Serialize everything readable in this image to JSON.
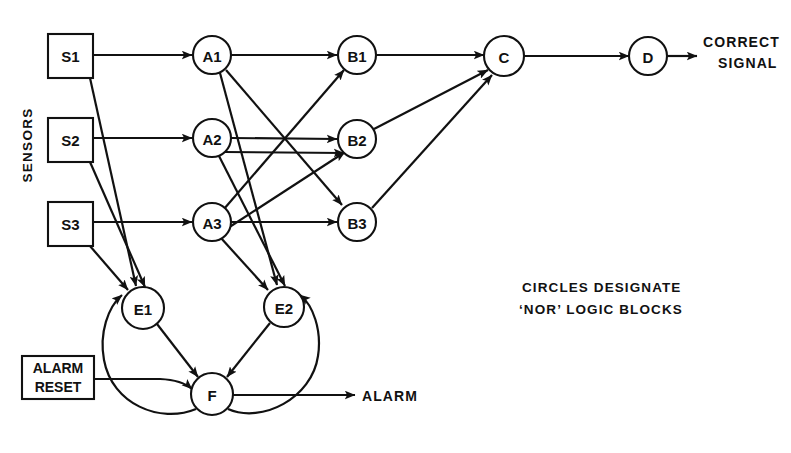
{
  "diagram": {
    "stroke_color": "#111111",
    "background_color": "#ffffff"
  },
  "labels": {
    "sensors_group": "SENSORS",
    "correct_signal_line1": "CORRECT",
    "correct_signal_line2": "SIGNAL",
    "alarm_output": "ALARM",
    "legend_line1": "CIRCLES  DESIGNATE",
    "legend_line2_quote_open": "‘",
    "legend_line2_strong": "NOR",
    "legend_line2_quote_close": "’",
    "legend_line2_rest": " LOGIC  BLOCKS"
  },
  "boxes": [
    {
      "id": "S1",
      "label": "S1",
      "x": 48,
      "y": 34,
      "w": 45,
      "h": 44
    },
    {
      "id": "S2",
      "label": "S2",
      "x": 48,
      "y": 118,
      "w": 45,
      "h": 44
    },
    {
      "id": "S3",
      "label": "S3",
      "x": 48,
      "y": 202,
      "w": 45,
      "h": 44
    },
    {
      "id": "ALARM_RESET",
      "label_line1": "ALARM",
      "label_line2": "RESET",
      "x": 22,
      "y": 356,
      "w": 72,
      "h": 43
    }
  ],
  "circles": [
    {
      "id": "A1",
      "label": "A1",
      "cx": 212,
      "cy": 55,
      "r": 19
    },
    {
      "id": "A2",
      "label": "A2",
      "cx": 212,
      "cy": 138,
      "r": 19
    },
    {
      "id": "A3",
      "label": "A3",
      "cx": 212,
      "cy": 222,
      "r": 19
    },
    {
      "id": "B1",
      "label": "B1",
      "cx": 357,
      "cy": 55,
      "r": 19
    },
    {
      "id": "B2",
      "label": "B2",
      "cx": 357,
      "cy": 139,
      "r": 19
    },
    {
      "id": "B3",
      "label": "B3",
      "cx": 357,
      "cy": 222,
      "r": 19
    },
    {
      "id": "C",
      "label": "C",
      "cx": 504,
      "cy": 56,
      "r": 20
    },
    {
      "id": "D",
      "label": "D",
      "cx": 648,
      "cy": 56,
      "r": 19
    },
    {
      "id": "E1",
      "label": "E1",
      "cx": 143,
      "cy": 308,
      "r": 21
    },
    {
      "id": "E2",
      "label": "E2",
      "cx": 284,
      "cy": 307,
      "r": 20
    },
    {
      "id": "F",
      "label": "F",
      "cx": 212,
      "cy": 394,
      "r": 21
    }
  ],
  "edges": [
    {
      "from": "S1",
      "to": "A1",
      "kind": "straight"
    },
    {
      "from": "S2",
      "to": "A2",
      "kind": "straight"
    },
    {
      "from": "S3",
      "to": "A3",
      "kind": "straight"
    },
    {
      "from": "S1",
      "to": "E1",
      "kind": "straight"
    },
    {
      "from": "S2",
      "to": "E1",
      "kind": "straight"
    },
    {
      "from": "S3",
      "to": "E1",
      "kind": "straight"
    },
    {
      "from": "A1",
      "to": "B1",
      "kind": "straight"
    },
    {
      "from": "A2",
      "to": "B2",
      "kind": "straight"
    },
    {
      "from": "A3",
      "to": "B3",
      "kind": "straight"
    },
    {
      "from": "A1",
      "to": "B3",
      "kind": "straight"
    },
    {
      "from": "A3",
      "to": "B1",
      "kind": "straight"
    },
    {
      "from": "A2",
      "to": "B2alt",
      "kind": "straight"
    },
    {
      "from": "A1",
      "to": "E2",
      "kind": "straight"
    },
    {
      "from": "A2",
      "to": "E2",
      "kind": "straight"
    },
    {
      "from": "A3",
      "to": "E2",
      "kind": "straight"
    },
    {
      "from": "B1",
      "to": "C",
      "kind": "straight"
    },
    {
      "from": "B2",
      "to": "C",
      "kind": "straight"
    },
    {
      "from": "B3",
      "to": "C",
      "kind": "straight"
    },
    {
      "from": "C",
      "to": "D",
      "kind": "straight"
    },
    {
      "from": "D",
      "to": "CORRECT SIGNAL",
      "kind": "output"
    },
    {
      "from": "E1",
      "to": "F",
      "kind": "straight"
    },
    {
      "from": "E2",
      "to": "F",
      "kind": "straight"
    },
    {
      "from": "ALARM_RESET",
      "to": "F",
      "kind": "curve"
    },
    {
      "from": "F",
      "to": "E1",
      "kind": "feedback-curve"
    },
    {
      "from": "F",
      "to": "E2",
      "kind": "feedback-curve"
    },
    {
      "from": "F",
      "to": "ALARM",
      "kind": "output"
    }
  ]
}
